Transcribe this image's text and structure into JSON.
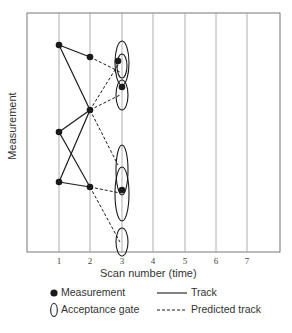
{
  "axes": {
    "x_label": "Scan number (time)",
    "y_label": "Measurement",
    "x_ticks": [
      "1",
      "2",
      "3",
      "4",
      "5",
      "6",
      "7"
    ]
  },
  "legend": {
    "measurement": "Measurement",
    "track": "Track",
    "acceptance_gate": "Acceptance gate",
    "predicted_track": "Predicted track"
  },
  "colors": {
    "line": "#1a1a1a",
    "grid": "#9a9a9a",
    "frame": "#555555"
  }
}
